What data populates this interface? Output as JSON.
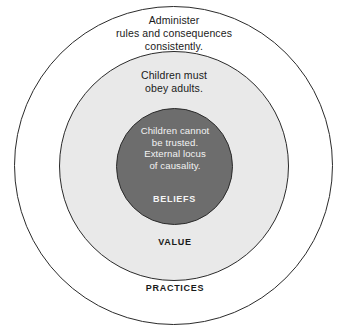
{
  "diagram": {
    "type": "concentric-circles",
    "title": "",
    "background_color": "#ffffff",
    "layers": [
      {
        "id": "practices",
        "label": "Practices",
        "description": "Administer\nrules and consequences\nconsistently.",
        "fill_color": "#ffffff",
        "stroke_color": "#2b2b2b",
        "text_color": "#1a1a1a",
        "label_color": "#1a1a1a",
        "level": 3
      },
      {
        "id": "value",
        "label": "Value",
        "description": "Children must\nobey adults.",
        "fill_color": "#e9e9e9",
        "stroke_color": "#2b2b2b",
        "text_color": "#1a1a1a",
        "label_color": "#1a1a1a",
        "level": 2
      },
      {
        "id": "beliefs",
        "label": "Beliefs",
        "description": "Children cannot\nbe trusted.\nExternal locus\nof causality.",
        "fill_color": "#6d6d6d",
        "stroke_color": "#2b2b2b",
        "text_color": "#f3f3f3",
        "label_color": "#f5f5f5",
        "level": 1
      }
    ]
  }
}
